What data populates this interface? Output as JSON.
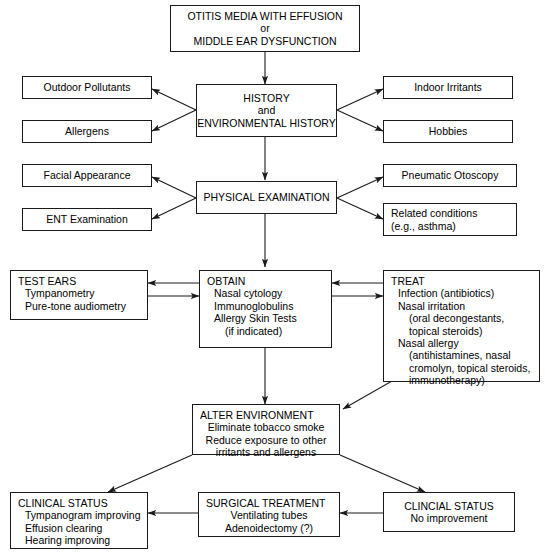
{
  "diagram": {
    "title_box": {
      "name": "otitis-media-title",
      "lines": [
        "OTITIS MEDIA WITH EFFUSION",
        "or",
        "MIDDLE EAR DYSFUNCTION"
      ]
    },
    "history": {
      "name": "history",
      "lines": [
        "HISTORY",
        "and",
        "ENVIRONMENTAL HISTORY"
      ]
    },
    "outdoor_pollutants": {
      "name": "outdoor-pollutants",
      "lines": [
        "Outdoor Pollutants"
      ]
    },
    "allergens": {
      "name": "allergens",
      "lines": [
        "Allergens"
      ]
    },
    "indoor_irritants": {
      "name": "indoor-irritants",
      "lines": [
        "Indoor Irritants"
      ]
    },
    "hobbies": {
      "name": "hobbies",
      "lines": [
        "Hobbies"
      ]
    },
    "physical_examination": {
      "name": "physical-examination",
      "lines": [
        "PHYSICAL EXAMINATION"
      ]
    },
    "facial_appearance": {
      "name": "facial-appearance",
      "lines": [
        "Facial Appearance"
      ]
    },
    "ent_examination": {
      "name": "ent-examination",
      "lines": [
        "ENT Examination"
      ]
    },
    "pneumatic_otoscopy": {
      "name": "pneumatic-otoscopy",
      "lines": [
        "Pneumatic Otoscopy"
      ]
    },
    "related_conditions": {
      "name": "related-conditions",
      "lines": [
        "Related conditions",
        "(e.g., asthma)"
      ]
    },
    "test_ears": {
      "name": "test-ears",
      "heading": "TEST EARS",
      "items": [
        "Tympanometry",
        "Pure-tone audiometry"
      ]
    },
    "obtain": {
      "name": "obtain",
      "heading": "OBTAIN",
      "items": [
        "Nasal cytology",
        "Immunoglobulins",
        "Allergy Skin Tests",
        "(if indicated)"
      ]
    },
    "treat": {
      "name": "treat",
      "heading": "TREAT",
      "items": [
        "Infection (antibiotics)",
        "Nasal irritation",
        "(oral decongestants,",
        "topical steroids)",
        "Nasal allergy",
        "(antihistamines, nasal",
        "cromolyn, topical steroids,",
        "immunotherapy)"
      ]
    },
    "alter_environment": {
      "name": "alter-environment",
      "heading": "ALTER ENVIRONMENT",
      "items": [
        "Eliminate tobacco smoke",
        "Reduce exposure to other",
        "irritants and allergens"
      ]
    },
    "clinical_status_improving": {
      "name": "clinical-status-improving",
      "heading": "CLINICAL STATUS",
      "items": [
        "Tympanogram improving",
        "Effusion clearing",
        "Hearing improving"
      ]
    },
    "surgical_treatment": {
      "name": "surgical-treatment",
      "heading": "SURGICAL TREATMENT",
      "items": [
        "Ventilating tubes",
        "Adenoidectomy (?)"
      ]
    },
    "clinical_status_no_improvement": {
      "name": "clinical-status-no-improvement",
      "heading": "CLINCIAL STATUS",
      "items": [
        "No improvement"
      ]
    }
  },
  "style": {
    "line_color": "#1a1a1a",
    "background": "#ffffff"
  }
}
